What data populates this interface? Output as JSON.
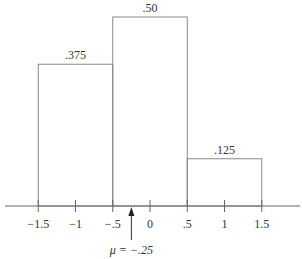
{
  "chart_data": {
    "type": "bar",
    "title": "",
    "xlabel": "",
    "ylabel": "",
    "bins": [
      {
        "left": -1.5,
        "right": -0.5,
        "value": 0.375,
        "label": ".375"
      },
      {
        "left": -0.5,
        "right": 0.5,
        "value": 0.5,
        "label": ".50"
      },
      {
        "left": 0.5,
        "right": 1.5,
        "value": 0.125,
        "label": ".125"
      }
    ],
    "categories": [
      "-1.5 to -.5",
      "-.5 to .5",
      ".5 to 1.5"
    ],
    "values": [
      0.375,
      0.5,
      0.125
    ],
    "x_ticks": [
      {
        "value": -1.5,
        "label": "−1.5"
      },
      {
        "value": -1,
        "label": "−1"
      },
      {
        "value": -0.5,
        "label": "−.5"
      },
      {
        "value": 0,
        "label": "0"
      },
      {
        "value": 0.5,
        "label": ".5"
      },
      {
        "value": 1,
        "label": "1"
      },
      {
        "value": 1.5,
        "label": "1.5"
      }
    ],
    "annotations": [
      {
        "x": -0.25,
        "text": "μ = −.25",
        "type": "arrow-up"
      }
    ],
    "grid": false,
    "legend": null
  },
  "style": {
    "line_color": "#888888",
    "axis_color": "#666666",
    "text_color": "#333333"
  }
}
